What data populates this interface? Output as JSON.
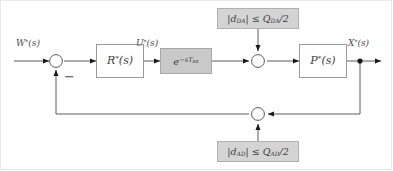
{
  "diagram": {
    "type": "block-diagram",
    "background_color": "#ffffff",
    "line_color": "#5a5a5a",
    "signals": {
      "reference": "W*(s)",
      "reference_symbol": "W",
      "reference_star": "*",
      "reference_arg": "(s)",
      "control": "U*(s)",
      "control_symbol": "U",
      "control_star": "*",
      "control_arg": "(s)",
      "output": "X*(s)",
      "output_symbol": "X",
      "output_star": "*",
      "output_arg": "(s)"
    },
    "blocks": [
      {
        "id": "controller",
        "label": "R*(s)",
        "symbol": "R",
        "star": "*",
        "arg": "(s)",
        "fill": "#ffffff",
        "style": "white"
      },
      {
        "id": "delay",
        "label": "e^(-sT_RK)",
        "base": "e",
        "exponent_minus": "−",
        "exponent_s": "s",
        "exponent_tau": "T",
        "exponent_sub": "RK",
        "fill": "#c9c9c9",
        "style": "gray"
      },
      {
        "id": "plant",
        "label": "P*(s)",
        "symbol": "P",
        "star": "*",
        "arg": "(s)",
        "fill": "#ffffff",
        "style": "white"
      }
    ],
    "disturbances": [
      {
        "id": "da-quantization",
        "position": "top",
        "label": "|d_DA| ≤ Q_DA/2",
        "abs_open": "|",
        "var": "d",
        "var_sub": "DA",
        "abs_close": "|",
        "relation": "≤",
        "bound": "Q",
        "bound_sub": "DA",
        "divisor": "/2",
        "fill": "#d4d4d4"
      },
      {
        "id": "ad-quantization",
        "position": "bottom",
        "label": "|d_AD| ≤ Q_AD/2",
        "abs_open": "|",
        "var": "d",
        "var_sub": "AD",
        "abs_close": "|",
        "relation": "≤",
        "bound": "Q",
        "bound_sub": "AD",
        "divisor": "/2",
        "fill": "#d4d4d4"
      }
    ],
    "summing_junctions": [
      {
        "id": "error-sum",
        "sign": "−",
        "sign_label": "minus"
      },
      {
        "id": "da-sum",
        "sign": "",
        "sign_label": "none"
      },
      {
        "id": "ad-sum",
        "sign": "",
        "sign_label": "none"
      }
    ]
  }
}
